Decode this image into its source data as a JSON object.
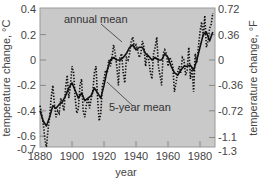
{
  "chart_data": {
    "type": "line",
    "title": "",
    "xlabel": "year",
    "ylabel": "temperature change, °C",
    "ylabel_right": "temperature change, °F",
    "xlim": [
      1880,
      1988
    ],
    "ylim": [
      -0.7,
      0.4
    ],
    "x_ticks": [
      1880,
      1900,
      1920,
      1940,
      1960,
      1980
    ],
    "y_ticks_left": [
      "0.4",
      "0.2",
      "0",
      "-0.2",
      "-0.4",
      "-0.6",
      "-0.7"
    ],
    "y_ticks_left_values": [
      0.4,
      0.2,
      0,
      -0.2,
      -0.4,
      -0.6,
      -0.7
    ],
    "y_ticks_right": [
      "0.72",
      "0.36",
      "0",
      "-0.36",
      "-0.72",
      "-1.1",
      "-1.3"
    ],
    "y_ticks_right_values": [
      0.4,
      0.2,
      0,
      -0.2,
      -0.4,
      -0.61,
      -0.72
    ],
    "grid": false,
    "legend": "inline annotations",
    "annotations": [
      {
        "text": "annual mean",
        "points_to": [
          1926,
          0.12
        ]
      },
      {
        "text": "5-year mean",
        "points_to": [
          1920,
          -0.17
        ]
      }
    ],
    "series": [
      {
        "name": "annual mean",
        "style": "dotted",
        "x": [
          1880,
          1881,
          1882,
          1883,
          1884,
          1885,
          1886,
          1887,
          1888,
          1889,
          1890,
          1891,
          1892,
          1893,
          1894,
          1895,
          1896,
          1897,
          1898,
          1899,
          1900,
          1901,
          1902,
          1903,
          1904,
          1905,
          1906,
          1907,
          1908,
          1909,
          1910,
          1911,
          1912,
          1913,
          1914,
          1915,
          1916,
          1917,
          1918,
          1919,
          1920,
          1921,
          1922,
          1923,
          1924,
          1925,
          1926,
          1927,
          1928,
          1929,
          1930,
          1931,
          1932,
          1933,
          1934,
          1935,
          1936,
          1937,
          1938,
          1939,
          1940,
          1941,
          1942,
          1943,
          1944,
          1945,
          1946,
          1947,
          1948,
          1949,
          1950,
          1951,
          1952,
          1953,
          1954,
          1955,
          1956,
          1957,
          1958,
          1959,
          1960,
          1961,
          1962,
          1963,
          1964,
          1965,
          1966,
          1967,
          1968,
          1969,
          1970,
          1971,
          1972,
          1973,
          1974,
          1975,
          1976,
          1977,
          1978,
          1979,
          1980,
          1981,
          1982,
          1983,
          1984,
          1985,
          1986,
          1987,
          1988
        ],
        "values": [
          -0.36,
          -0.42,
          -0.5,
          -0.62,
          -0.7,
          -0.55,
          -0.45,
          -0.3,
          -0.2,
          -0.35,
          -0.45,
          -0.4,
          -0.42,
          -0.3,
          -0.35,
          -0.4,
          -0.22,
          -0.12,
          -0.3,
          -0.2,
          -0.05,
          -0.1,
          -0.3,
          -0.42,
          -0.38,
          -0.2,
          -0.15,
          -0.4,
          -0.45,
          -0.35,
          -0.3,
          -0.38,
          -0.3,
          -0.25,
          -0.1,
          -0.05,
          -0.3,
          -0.48,
          -0.42,
          -0.2,
          -0.15,
          -0.08,
          -0.1,
          0.0,
          -0.05,
          0.02,
          0.12,
          0.05,
          -0.05,
          -0.2,
          0.02,
          0.05,
          -0.1,
          -0.18,
          0.02,
          0.0,
          0.05,
          0.15,
          0.18,
          0.1,
          0.12,
          0.08,
          0.02,
          0.05,
          0.15,
          0.1,
          -0.05,
          0.05,
          0.0,
          -0.1,
          -0.15,
          0.05,
          0.1,
          0.18,
          -0.05,
          -0.12,
          -0.2,
          0.05,
          0.08,
          0.05,
          -0.05,
          0.02,
          0.0,
          -0.05,
          -0.25,
          -0.18,
          -0.1,
          -0.05,
          -0.1,
          0.02,
          0.0,
          -0.12,
          -0.08,
          0.1,
          -0.15,
          -0.05,
          -0.25,
          0.05,
          -0.02,
          0.1,
          0.22,
          0.3,
          0.18,
          0.35,
          0.1,
          0.15,
          0.25,
          0.28,
          0.37
        ]
      },
      {
        "name": "5-year mean",
        "style": "solid",
        "x": [
          1880,
          1882,
          1884,
          1886,
          1888,
          1890,
          1892,
          1894,
          1896,
          1898,
          1900,
          1902,
          1904,
          1906,
          1908,
          1910,
          1912,
          1914,
          1916,
          1918,
          1920,
          1922,
          1924,
          1926,
          1928,
          1930,
          1932,
          1934,
          1936,
          1938,
          1940,
          1942,
          1944,
          1946,
          1948,
          1950,
          1952,
          1954,
          1956,
          1958,
          1960,
          1962,
          1964,
          1966,
          1968,
          1970,
          1972,
          1974,
          1976,
          1978,
          1980,
          1982,
          1984,
          1986,
          1988
        ],
        "values": [
          -0.4,
          -0.48,
          -0.52,
          -0.45,
          -0.36,
          -0.38,
          -0.35,
          -0.33,
          -0.28,
          -0.22,
          -0.18,
          -0.24,
          -0.3,
          -0.26,
          -0.32,
          -0.3,
          -0.28,
          -0.22,
          -0.26,
          -0.3,
          -0.2,
          -0.08,
          0.0,
          0.02,
          0.0,
          0.0,
          0.02,
          0.05,
          0.1,
          0.12,
          0.08,
          0.1,
          0.1,
          0.05,
          0.03,
          0.0,
          0.02,
          0.0,
          0.0,
          0.05,
          0.02,
          -0.05,
          -0.1,
          -0.12,
          -0.08,
          -0.05,
          -0.05,
          -0.04,
          -0.08,
          0.0,
          0.1,
          0.2,
          0.22,
          0.15,
          0.22
        ]
      }
    ]
  },
  "labels": {
    "annual_mean": "annual mean",
    "five_year_mean": "5-year mean",
    "xlabel": "year",
    "ylabel_left": "temperature change, °C",
    "ylabel_right": "temperature change, °F"
  },
  "colors": {
    "plot_background": "#c9c9c9",
    "line": "#111111",
    "axis": "#888888",
    "text": "#444444"
  }
}
